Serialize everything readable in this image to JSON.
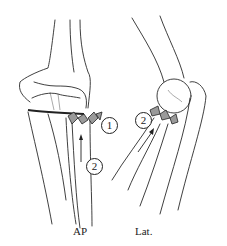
{
  "figure": {
    "views": [
      {
        "id": "ap",
        "label": "AP"
      },
      {
        "id": "lat",
        "label": "Lat."
      }
    ],
    "callouts": {
      "ap_1": "1",
      "ap_2": "2",
      "lat_2": "2"
    },
    "colors": {
      "line": "#2a2a2a",
      "fragment": "#9a9a9a",
      "background": "#ffffff"
    }
  }
}
